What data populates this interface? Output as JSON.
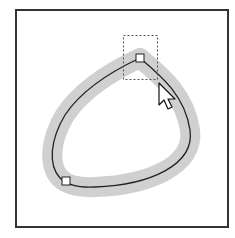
{
  "figure": {
    "colors": {
      "frame": "#333333",
      "stroke_fill": "#d0d0d0",
      "path_line": "#222222",
      "anchor_fill": "#ffffff",
      "marquee": "#555555",
      "background": "#ffffff"
    },
    "anchors": [
      {
        "name": "top-anchor",
        "x": 140,
        "y": 58,
        "selected": true
      },
      {
        "name": "bottom-left-anchor",
        "x": 66,
        "y": 181,
        "selected": false
      }
    ],
    "marquee": {
      "x": 123,
      "y": 35,
      "width": 35,
      "height": 45
    },
    "cursor": {
      "type": "arrow",
      "x": 159,
      "y": 83
    }
  }
}
